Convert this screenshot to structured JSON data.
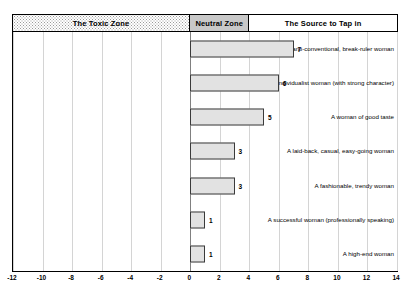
{
  "chart_data": {
    "type": "bar",
    "orientation": "horizontal",
    "title": "",
    "xlabel": "",
    "ylabel": "",
    "xlim": [
      -12,
      14
    ],
    "xticks": [
      "-12",
      "-10",
      "-8",
      "-6",
      "-4",
      "-2",
      "0",
      "2",
      "4",
      "6",
      "8",
      "10",
      "12",
      "14"
    ],
    "xtick_values": [
      -12,
      -10,
      -8,
      -6,
      -4,
      -2,
      0,
      2,
      4,
      6,
      8,
      10,
      12,
      14
    ],
    "grid": true,
    "legend": "none",
    "categories": [
      "An anti-conventional, break-ruler woman",
      "An individualist woman (with strong character)",
      "A woman of good taste",
      "A laid-back, casual, easy-going woman",
      "A fashionable, trendy woman",
      "A successful woman (professionally speaking)",
      "A high-end woman"
    ],
    "values": [
      7,
      6,
      5,
      3,
      3,
      1,
      1
    ],
    "value_labels": [
      "7",
      "6",
      "5",
      "3",
      "3",
      "1",
      "1"
    ],
    "bar_fill": "#e2e2e2",
    "bar_border": "#3a3a3a"
  },
  "zones": {
    "items": [
      {
        "label": "The Toxic Zone",
        "fill": "#ffffff",
        "pattern": "dotted",
        "from": -12,
        "to": 0
      },
      {
        "label": "Neutral Zone",
        "fill": "#c8c8c8",
        "pattern": "solid",
        "from": 0,
        "to": 4
      },
      {
        "label": "The Source to Tap in",
        "fill": "#ffffff",
        "pattern": "none",
        "from": 4,
        "to": 14
      }
    ]
  },
  "colors": {
    "gridline": "#d4d4d4",
    "zero_line": "#808080",
    "frame": "#000000"
  }
}
